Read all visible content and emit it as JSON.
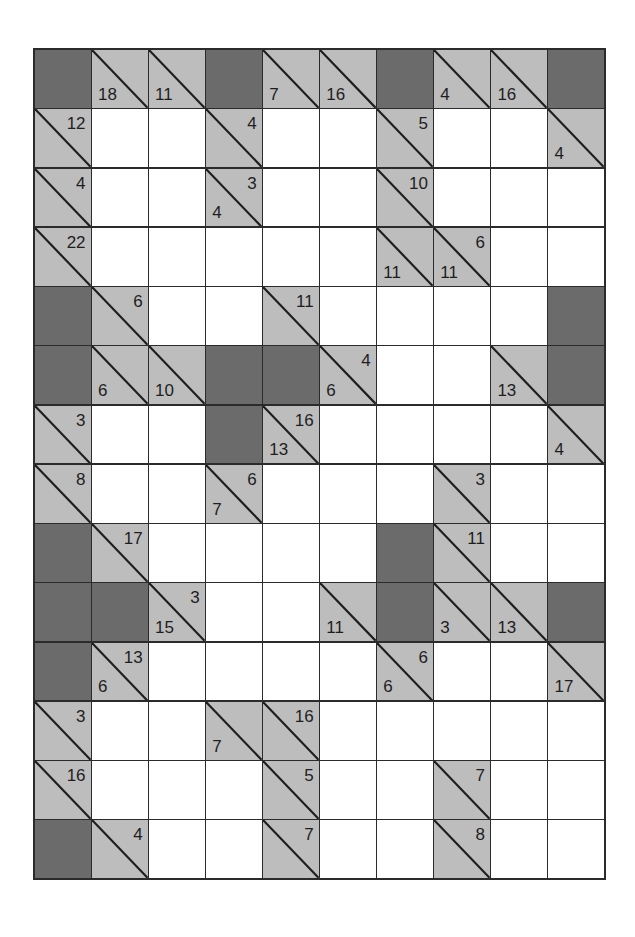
{
  "puzzle": {
    "type": "kakuro",
    "rows": 14,
    "cols": 10,
    "colors": {
      "block": "#6b6b6b",
      "clue": "#bdbdbd",
      "entry": "#ffffff",
      "line": "#2b2b2b"
    },
    "grid": [
      [
        {
          "t": "B"
        },
        {
          "t": "C",
          "d": "18"
        },
        {
          "t": "C",
          "d": "11"
        },
        {
          "t": "B"
        },
        {
          "t": "C",
          "d": "7"
        },
        {
          "t": "C",
          "d": "16"
        },
        {
          "t": "B"
        },
        {
          "t": "C",
          "d": "4"
        },
        {
          "t": "C",
          "d": "16"
        },
        {
          "t": "B"
        }
      ],
      [
        {
          "t": "C",
          "r": "12"
        },
        {
          "t": "W"
        },
        {
          "t": "W"
        },
        {
          "t": "C",
          "r": "4"
        },
        {
          "t": "W"
        },
        {
          "t": "W"
        },
        {
          "t": "C",
          "r": "5"
        },
        {
          "t": "W"
        },
        {
          "t": "W"
        },
        {
          "t": "C",
          "d": "4"
        }
      ],
      [
        {
          "t": "C",
          "r": "4"
        },
        {
          "t": "W"
        },
        {
          "t": "W"
        },
        {
          "t": "C",
          "r": "3",
          "d": "4"
        },
        {
          "t": "W"
        },
        {
          "t": "W"
        },
        {
          "t": "C",
          "r": "10"
        },
        {
          "t": "W"
        },
        {
          "t": "W"
        },
        {
          "t": "W"
        }
      ],
      [
        {
          "t": "C",
          "r": "22"
        },
        {
          "t": "W"
        },
        {
          "t": "W"
        },
        {
          "t": "W"
        },
        {
          "t": "W"
        },
        {
          "t": "W"
        },
        {
          "t": "C",
          "d": "11"
        },
        {
          "t": "C",
          "r": "6",
          "d": "11"
        },
        {
          "t": "W"
        },
        {
          "t": "W"
        }
      ],
      [
        {
          "t": "B"
        },
        {
          "t": "C",
          "r": "6"
        },
        {
          "t": "W"
        },
        {
          "t": "W"
        },
        {
          "t": "C",
          "r": "11"
        },
        {
          "t": "W"
        },
        {
          "t": "W"
        },
        {
          "t": "W"
        },
        {
          "t": "W"
        },
        {
          "t": "B"
        }
      ],
      [
        {
          "t": "B"
        },
        {
          "t": "C",
          "d": "6"
        },
        {
          "t": "C",
          "d": "10"
        },
        {
          "t": "B"
        },
        {
          "t": "B"
        },
        {
          "t": "C",
          "r": "4",
          "d": "6"
        },
        {
          "t": "W"
        },
        {
          "t": "W"
        },
        {
          "t": "C",
          "d": "13"
        },
        {
          "t": "B"
        }
      ],
      [
        {
          "t": "C",
          "r": "3"
        },
        {
          "t": "W"
        },
        {
          "t": "W"
        },
        {
          "t": "B"
        },
        {
          "t": "C",
          "r": "16",
          "d": "13"
        },
        {
          "t": "W"
        },
        {
          "t": "W"
        },
        {
          "t": "W"
        },
        {
          "t": "W"
        },
        {
          "t": "C",
          "d": "4"
        }
      ],
      [
        {
          "t": "C",
          "r": "8"
        },
        {
          "t": "W"
        },
        {
          "t": "W"
        },
        {
          "t": "C",
          "r": "6",
          "d": "7"
        },
        {
          "t": "W"
        },
        {
          "t": "W"
        },
        {
          "t": "W"
        },
        {
          "t": "C",
          "r": "3"
        },
        {
          "t": "W"
        },
        {
          "t": "W"
        }
      ],
      [
        {
          "t": "B"
        },
        {
          "t": "C",
          "r": "17"
        },
        {
          "t": "W"
        },
        {
          "t": "W"
        },
        {
          "t": "W"
        },
        {
          "t": "W"
        },
        {
          "t": "B"
        },
        {
          "t": "C",
          "r": "11"
        },
        {
          "t": "W"
        },
        {
          "t": "W"
        }
      ],
      [
        {
          "t": "B"
        },
        {
          "t": "B"
        },
        {
          "t": "C",
          "r": "3",
          "d": "15"
        },
        {
          "t": "W"
        },
        {
          "t": "W"
        },
        {
          "t": "C",
          "d": "11"
        },
        {
          "t": "B"
        },
        {
          "t": "C",
          "d": "3"
        },
        {
          "t": "C",
          "d": "13"
        },
        {
          "t": "B"
        }
      ],
      [
        {
          "t": "B"
        },
        {
          "t": "C",
          "r": "13",
          "d": "6"
        },
        {
          "t": "W"
        },
        {
          "t": "W"
        },
        {
          "t": "W"
        },
        {
          "t": "W"
        },
        {
          "t": "C",
          "r": "6",
          "d": "6"
        },
        {
          "t": "W"
        },
        {
          "t": "W"
        },
        {
          "t": "C",
          "d": "17"
        }
      ],
      [
        {
          "t": "C",
          "r": "3"
        },
        {
          "t": "W"
        },
        {
          "t": "W"
        },
        {
          "t": "C",
          "d": "7"
        },
        {
          "t": "C",
          "r": "16"
        },
        {
          "t": "W"
        },
        {
          "t": "W"
        },
        {
          "t": "W"
        },
        {
          "t": "W"
        },
        {
          "t": "W"
        }
      ],
      [
        {
          "t": "C",
          "r": "16"
        },
        {
          "t": "W"
        },
        {
          "t": "W"
        },
        {
          "t": "W"
        },
        {
          "t": "C",
          "r": "5"
        },
        {
          "t": "W"
        },
        {
          "t": "W"
        },
        {
          "t": "C",
          "r": "7"
        },
        {
          "t": "W"
        },
        {
          "t": "W"
        }
      ],
      [
        {
          "t": "B"
        },
        {
          "t": "C",
          "r": "4"
        },
        {
          "t": "W"
        },
        {
          "t": "W"
        },
        {
          "t": "C",
          "r": "7"
        },
        {
          "t": "W"
        },
        {
          "t": "W"
        },
        {
          "t": "C",
          "r": "8"
        },
        {
          "t": "W"
        },
        {
          "t": "W"
        }
      ]
    ]
  }
}
